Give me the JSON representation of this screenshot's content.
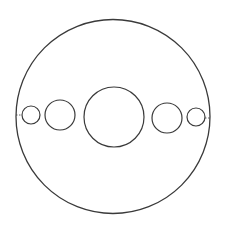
{
  "diagram": {
    "width": 225,
    "height": 232,
    "background": "#ffffff",
    "stroke_color": "#3a3a3a",
    "outer_circle": {
      "cx": 113,
      "cy": 116.5,
      "r": 97,
      "stroke_width": 1.3
    },
    "circles": [
      {
        "id": "small-left",
        "cx": 31,
        "cy": 115,
        "r": 9,
        "stroke_width": 1.2
      },
      {
        "id": "medium-left",
        "cx": 60,
        "cy": 115,
        "r": 15,
        "stroke_width": 1.2
      },
      {
        "id": "center",
        "cx": 114,
        "cy": 117,
        "r": 30,
        "stroke_width": 1.2
      },
      {
        "id": "medium-right",
        "cx": 167,
        "cy": 118,
        "r": 15,
        "stroke_width": 1.2
      },
      {
        "id": "small-right",
        "cx": 196,
        "cy": 117,
        "r": 9,
        "stroke_width": 1.2
      }
    ],
    "connectors": [
      {
        "id": "left-connector",
        "x1": 16,
        "y1": 115,
        "x2": 22,
        "y2": 115,
        "dash": "1.5,1.5"
      },
      {
        "id": "right-connector",
        "x1": 205,
        "y1": 118,
        "x2": 210,
        "y2": 118,
        "dash": "1.5,1.5"
      }
    ]
  }
}
